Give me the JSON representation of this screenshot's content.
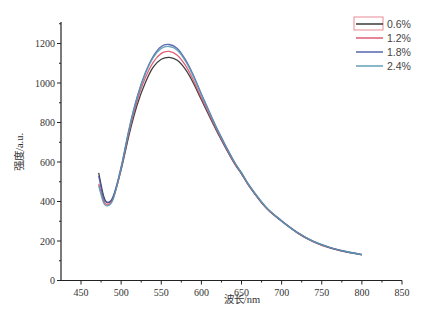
{
  "chart_data": {
    "type": "line",
    "title": "",
    "xlabel": "波长/nm",
    "ylabel": "强度/a.u.",
    "xlim": [
      425,
      850
    ],
    "ylim": [
      0,
      1300
    ],
    "xticks": [
      450,
      500,
      550,
      600,
      650,
      700,
      750,
      800,
      850
    ],
    "yticks": [
      0,
      200,
      400,
      600,
      800,
      1000,
      1200
    ],
    "grid": false,
    "legend_position": "upper right",
    "x": [
      472,
      478,
      483,
      490,
      500,
      510,
      520,
      530,
      540,
      550,
      560,
      570,
      580,
      590,
      600,
      620,
      640,
      650,
      660,
      680,
      700,
      720,
      740,
      760,
      780,
      800
    ],
    "series": [
      {
        "name": "0.6%",
        "color": "#2b2b2b",
        "values": [
          545,
          430,
          395,
          420,
          560,
          740,
          890,
          1000,
          1080,
          1120,
          1130,
          1115,
          1070,
          1000,
          915,
          750,
          600,
          540,
          475,
          370,
          300,
          240,
          195,
          165,
          145,
          130
        ]
      },
      {
        "name": "1.2%",
        "color": "#e0506a",
        "values": [
          490,
          405,
          385,
          415,
          565,
          755,
          910,
          1025,
          1105,
          1150,
          1160,
          1140,
          1090,
          1015,
          925,
          755,
          602,
          542,
          476,
          371,
          301,
          241,
          196,
          166,
          146,
          131
        ]
      },
      {
        "name": "1.8%",
        "color": "#4a5aa8",
        "values": [
          530,
          420,
          395,
          425,
          575,
          770,
          930,
          1050,
          1135,
          1185,
          1195,
          1175,
          1120,
          1040,
          945,
          765,
          608,
          546,
          480,
          374,
          303,
          243,
          198,
          168,
          147,
          132
        ]
      },
      {
        "name": "2.4%",
        "color": "#5a9ab0",
        "values": [
          480,
          395,
          378,
          410,
          570,
          765,
          925,
          1045,
          1128,
          1175,
          1185,
          1166,
          1112,
          1034,
          940,
          762,
          606,
          545,
          479,
          373,
          302,
          242,
          197,
          167,
          147,
          131
        ]
      }
    ]
  }
}
